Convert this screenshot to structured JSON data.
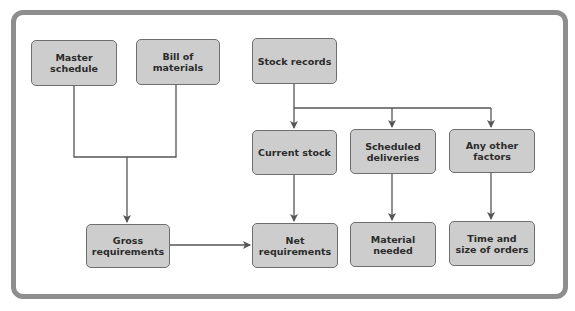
{
  "diagram": {
    "nodes": {
      "master_schedule": {
        "label": "Master schedule"
      },
      "bill_of_materials": {
        "label": "Bill of materials"
      },
      "stock_records": {
        "label": "Stock records"
      },
      "current_stock": {
        "label": "Current stock"
      },
      "scheduled_deliveries": {
        "line1": "Scheduled",
        "line2": "deliveries"
      },
      "any_other_factors": {
        "line1": "Any other",
        "line2": "factors"
      },
      "gross_requirements": {
        "line1": "Gross",
        "line2": "requirements"
      },
      "net_requirements": {
        "label": "Net requirements"
      },
      "material_needed": {
        "label": "Material needed"
      },
      "time_and_size": {
        "line1": "Time and",
        "line2": "size of orders"
      }
    },
    "edges": [
      {
        "from": "master_schedule",
        "to": "gross_requirements"
      },
      {
        "from": "bill_of_materials",
        "to": "gross_requirements"
      },
      {
        "from": "stock_records",
        "to": "current_stock"
      },
      {
        "from": "stock_records",
        "to": "scheduled_deliveries"
      },
      {
        "from": "stock_records",
        "to": "any_other_factors"
      },
      {
        "from": "gross_requirements",
        "to": "net_requirements"
      },
      {
        "from": "current_stock",
        "to": "net_requirements"
      },
      {
        "from": "scheduled_deliveries",
        "to": "material_needed"
      },
      {
        "from": "any_other_factors",
        "to": "time_and_size"
      }
    ],
    "colors": {
      "box_fill": "#cdcdcd",
      "box_border": "#6e6e6e",
      "line": "#555555",
      "frame": "#8e8e8e"
    }
  }
}
